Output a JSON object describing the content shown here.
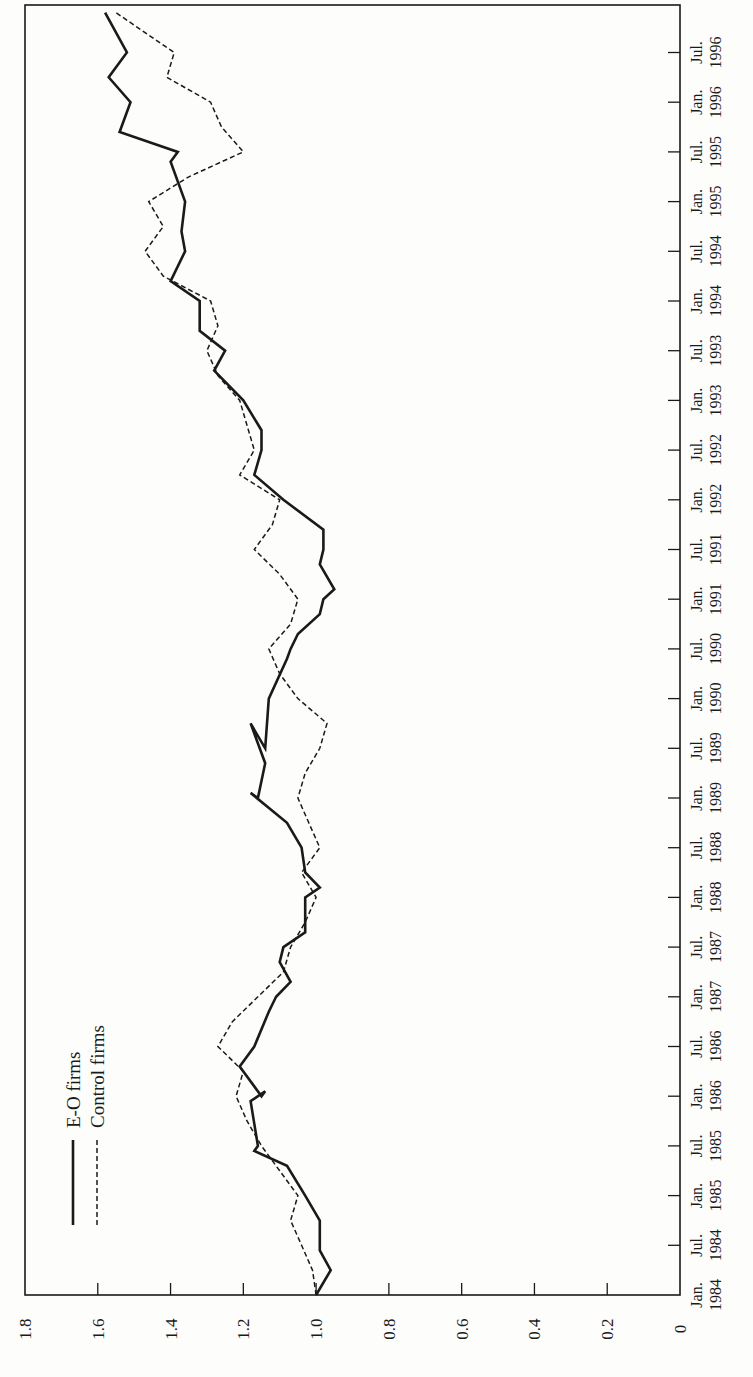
{
  "chart_data": {
    "type": "line",
    "orientation": "rotated-90-ccw",
    "title": "",
    "xlabel": "",
    "ylabel": "",
    "ylim": [
      0,
      1.8
    ],
    "y_ticks": [
      "0",
      "0.2",
      "0.4",
      "0.6",
      "0.8",
      "1.0",
      "1.2",
      "1.4",
      "1.6",
      "1.8"
    ],
    "x_tick_labels": [
      [
        "Jan.",
        "1984"
      ],
      [
        "Jul.",
        "1984"
      ],
      [
        "Jan.",
        "1985"
      ],
      [
        "Jul.",
        "1985"
      ],
      [
        "Jan.",
        "1986"
      ],
      [
        "Jul.",
        "1986"
      ],
      [
        "Jan.",
        "1987"
      ],
      [
        "Jul.",
        "1987"
      ],
      [
        "Jan.",
        "1988"
      ],
      [
        "Jul.",
        "1988"
      ],
      [
        "Jan.",
        "1989"
      ],
      [
        "Jul.",
        "1989"
      ],
      [
        "Jan.",
        "1990"
      ],
      [
        "Jul.",
        "1990"
      ],
      [
        "Jan.",
        "1991"
      ],
      [
        "Jul.",
        "1991"
      ],
      [
        "Jan.",
        "1992"
      ],
      [
        "Jul.",
        "1992"
      ],
      [
        "Jan.",
        "1993"
      ],
      [
        "Jul.",
        "1993"
      ],
      [
        "Jan.",
        "1994"
      ],
      [
        "Jul.",
        "1994"
      ],
      [
        "Jan.",
        "1995"
      ],
      [
        "Jul.",
        "1995"
      ],
      [
        "Jan.",
        "1996"
      ],
      [
        "Jul.",
        "1996"
      ]
    ],
    "grid": false,
    "legend_position": "upper-left (rotated)",
    "x_units": "half-years since Jan. 1984",
    "series": [
      {
        "name": "E-O firms",
        "style": "solid",
        "x": [
          0,
          0.5,
          0.9,
          1,
          1.5,
          2,
          2.6,
          2.9,
          3,
          3.9,
          4.1,
          4,
          4.6,
          5,
          5.7,
          6,
          6.3,
          6.7,
          7,
          7.3,
          8,
          8.2,
          8.5,
          9,
          9.5,
          10.1,
          10,
          10.7,
          11.5,
          11,
          12,
          12.8,
          13,
          13.3,
          13.7,
          14,
          14.2,
          14.7,
          15,
          15.4,
          16,
          16.5,
          17,
          17.4,
          18,
          18.6,
          19,
          19.4,
          20,
          20.4,
          21,
          21.4,
          22,
          22.8,
          23,
          23.4,
          24,
          24.5,
          25,
          25.8
        ],
        "values": [
          1.0,
          0.96,
          0.99,
          0.99,
          0.99,
          1.03,
          1.08,
          1.17,
          1.16,
          1.18,
          1.14,
          1.15,
          1.21,
          1.17,
          1.13,
          1.11,
          1.07,
          1.1,
          1.09,
          1.03,
          1.03,
          0.99,
          1.03,
          1.04,
          1.08,
          1.18,
          1.16,
          1.14,
          1.18,
          1.14,
          1.13,
          1.08,
          1.07,
          1.05,
          0.99,
          0.98,
          0.95,
          0.99,
          0.98,
          0.98,
          1.09,
          1.17,
          1.15,
          1.15,
          1.2,
          1.28,
          1.25,
          1.32,
          1.32,
          1.4,
          1.36,
          1.37,
          1.36,
          1.4,
          1.38,
          1.54,
          1.51,
          1.57,
          1.52,
          1.58
        ]
      },
      {
        "name": "Control firms",
        "style": "dashed",
        "x": [
          0,
          0.5,
          1,
          1.5,
          2,
          2.5,
          3,
          3.5,
          4,
          4.5,
          5,
          5.5,
          6,
          6.5,
          7,
          7.5,
          8,
          8.5,
          9,
          9.5,
          10,
          10.5,
          11,
          11.5,
          12,
          12.5,
          13,
          13.5,
          14,
          14.5,
          15,
          15.5,
          16,
          16.5,
          17,
          17.5,
          18,
          18.5,
          19,
          19.5,
          20,
          20.5,
          21,
          21.5,
          22,
          22.5,
          23,
          23.5,
          24,
          24.5,
          25,
          25.8
        ],
        "values": [
          1.0,
          1.01,
          1.04,
          1.07,
          1.05,
          1.1,
          1.15,
          1.19,
          1.22,
          1.2,
          1.27,
          1.23,
          1.16,
          1.09,
          1.07,
          1.03,
          1.0,
          1.04,
          0.99,
          1.02,
          1.05,
          1.03,
          0.99,
          0.97,
          1.05,
          1.1,
          1.13,
          1.07,
          1.05,
          1.1,
          1.17,
          1.12,
          1.1,
          1.21,
          1.17,
          1.19,
          1.21,
          1.27,
          1.3,
          1.27,
          1.29,
          1.42,
          1.47,
          1.42,
          1.46,
          1.35,
          1.2,
          1.26,
          1.29,
          1.41,
          1.39,
          1.55
        ]
      }
    ]
  },
  "legend": {
    "items": [
      {
        "label": "E-O firms",
        "style": "solid"
      },
      {
        "label": "Control firms",
        "style": "dashed"
      }
    ]
  },
  "colors": {
    "line": "#1a1a1a",
    "frame": "#1a1a1a",
    "background": "#fdfdfc"
  }
}
